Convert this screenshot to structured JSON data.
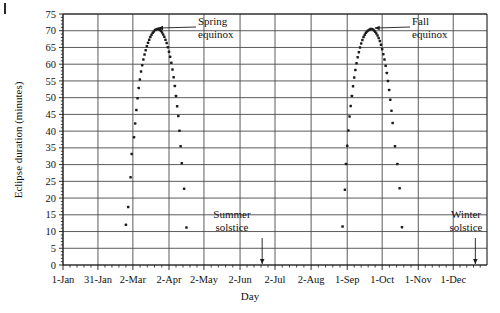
{
  "figure": {
    "type": "scatter-chart",
    "background": "#ffffff",
    "ink_color": "#1a1a1a"
  },
  "chart_data": {
    "type": "scatter",
    "title": "",
    "xlabel": "Day",
    "ylabel": "Eclipse duration (minutes)",
    "ylim": [
      0,
      75
    ],
    "ytick_labels": [
      "0",
      "5",
      "10",
      "15",
      "20",
      "25",
      "30",
      "35",
      "40",
      "45",
      "50",
      "55",
      "60",
      "65",
      "70",
      "75"
    ],
    "ytick_values": [
      0,
      5,
      10,
      15,
      20,
      25,
      30,
      35,
      40,
      45,
      50,
      55,
      60,
      65,
      70,
      75
    ],
    "xtick_labels": [
      "1-Jan",
      "31-Jan",
      "2-Mar",
      "2-Apr",
      "2-May",
      "2-Jun",
      "2-Jul",
      "2-Aug",
      "1-Sep",
      "1-Oct",
      "1-Nov",
      "1-Dec"
    ],
    "xtick_day_numbers": [
      1,
      31,
      61,
      92,
      122,
      153,
      183,
      214,
      245,
      275,
      306,
      336
    ],
    "xlim_days": [
      1,
      365
    ],
    "grid": true,
    "grid_x": true,
    "grid_y": true,
    "minor_ticks_per_interval": 5,
    "annotations": [
      {
        "label_line1": "Spring",
        "label_line2": "equinox",
        "target_day": 80,
        "target_value": 70.5
      },
      {
        "label_line1": "Fall",
        "label_line2": "equinox",
        "target_day": 266,
        "target_value": 70.5
      },
      {
        "label_line1": "Summer",
        "label_line2": "solstice",
        "target_day": 172,
        "target_value": 0
      },
      {
        "label_line1": "Winter",
        "label_line2": "solstice",
        "target_day": 355,
        "target_value": 0
      }
    ],
    "series": [
      {
        "name": "Eclipse duration",
        "marker": "filled-square-dot",
        "points": [
          [
            55,
            12.0
          ],
          [
            57,
            17.3
          ],
          [
            59,
            26.2
          ],
          [
            60,
            33.2
          ],
          [
            62,
            38.2
          ],
          [
            63,
            42.3
          ],
          [
            64,
            46.3
          ],
          [
            65,
            49.8
          ],
          [
            66,
            52.9
          ],
          [
            67,
            55.4
          ],
          [
            68,
            57.8
          ],
          [
            69,
            59.7
          ],
          [
            70,
            61.4
          ],
          [
            71,
            62.9
          ],
          [
            72,
            64.2
          ],
          [
            73,
            65.4
          ],
          [
            74,
            66.4
          ],
          [
            75,
            67.3
          ],
          [
            76,
            68.1
          ],
          [
            77,
            68.8
          ],
          [
            78,
            69.4
          ],
          [
            79,
            69.8
          ],
          [
            80,
            70.2
          ],
          [
            81,
            70.4
          ],
          [
            82,
            70.5
          ],
          [
            83,
            70.5
          ],
          [
            84,
            70.3
          ],
          [
            85,
            70.0
          ],
          [
            86,
            69.5
          ],
          [
            87,
            68.9
          ],
          [
            88,
            68.2
          ],
          [
            89,
            67.3
          ],
          [
            90,
            66.3
          ],
          [
            91,
            65.1
          ],
          [
            92,
            63.7
          ],
          [
            93,
            62.2
          ],
          [
            94,
            60.4
          ],
          [
            95,
            58.4
          ],
          [
            96,
            56.1
          ],
          [
            97,
            53.5
          ],
          [
            98,
            50.5
          ],
          [
            99,
            47.4
          ],
          [
            100,
            44.5
          ],
          [
            101,
            40.1
          ],
          [
            102,
            35.5
          ],
          [
            103,
            30.4
          ],
          [
            105,
            22.8
          ],
          [
            107,
            11.2
          ],
          [
            241,
            11.5
          ],
          [
            243,
            22.5
          ],
          [
            244,
            30.2
          ],
          [
            245,
            35.6
          ],
          [
            246,
            40.2
          ],
          [
            247,
            44.4
          ],
          [
            248,
            47.5
          ],
          [
            249,
            50.5
          ],
          [
            250,
            53.4
          ],
          [
            251,
            56.0
          ],
          [
            252,
            58.3
          ],
          [
            253,
            60.3
          ],
          [
            254,
            62.1
          ],
          [
            255,
            63.6
          ],
          [
            256,
            65.0
          ],
          [
            257,
            66.2
          ],
          [
            258,
            67.2
          ],
          [
            259,
            68.1
          ],
          [
            260,
            68.8
          ],
          [
            261,
            69.4
          ],
          [
            262,
            69.8
          ],
          [
            263,
            70.1
          ],
          [
            264,
            70.3
          ],
          [
            265,
            70.5
          ],
          [
            266,
            70.5
          ],
          [
            267,
            70.4
          ],
          [
            268,
            70.1
          ],
          [
            269,
            69.7
          ],
          [
            270,
            69.2
          ],
          [
            271,
            68.6
          ],
          [
            272,
            67.8
          ],
          [
            273,
            66.9
          ],
          [
            274,
            65.8
          ],
          [
            275,
            64.5
          ],
          [
            276,
            63.0
          ],
          [
            277,
            61.4
          ],
          [
            278,
            59.5
          ],
          [
            279,
            57.4
          ],
          [
            280,
            55.0
          ],
          [
            281,
            52.3
          ],
          [
            282,
            49.4
          ],
          [
            283,
            46.1
          ],
          [
            284,
            42.4
          ],
          [
            286,
            35.5
          ],
          [
            288,
            30.2
          ],
          [
            290,
            22.9
          ],
          [
            292,
            11.3
          ]
        ]
      }
    ]
  }
}
